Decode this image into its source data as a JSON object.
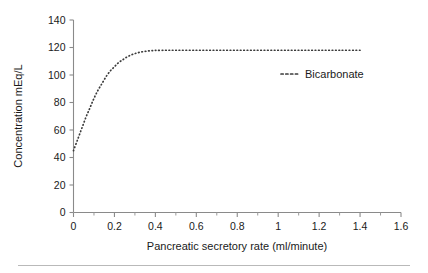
{
  "chart_data": {
    "type": "line",
    "title": "",
    "xlabel": "Pancreatic secretory rate (ml/minute)",
    "ylabel": "Concentration mEq/L",
    "xlim": [
      0,
      1.6
    ],
    "ylim": [
      0,
      140
    ],
    "grid": false,
    "legend_position": "inside-right",
    "xticks": [
      0,
      0.2,
      0.4,
      0.6,
      0.8,
      1,
      1.2,
      1.4,
      1.6
    ],
    "xtick_labels": [
      "0",
      "0.2",
      "0.4",
      "0.6",
      "0.8",
      "1",
      "1.2",
      "1.4",
      "1.6"
    ],
    "xtick_minor_step": 0.1,
    "yticks": [
      0,
      20,
      40,
      60,
      80,
      100,
      120,
      140
    ],
    "ytick_labels": [
      "0",
      "20",
      "40",
      "60",
      "80",
      "100",
      "120",
      "140"
    ],
    "series": [
      {
        "name": "Bicarbonate",
        "style": "dotted",
        "color": "#3b3b3b",
        "x": [
          0.0,
          0.02,
          0.04,
          0.06,
          0.08,
          0.1,
          0.12,
          0.14,
          0.16,
          0.18,
          0.2,
          0.22,
          0.24,
          0.26,
          0.28,
          0.3,
          0.32,
          0.34,
          0.36,
          0.38,
          0.4,
          0.45,
          0.5,
          0.6,
          0.7,
          0.8,
          0.9,
          1.0,
          1.1,
          1.2,
          1.3,
          1.4
        ],
        "values": [
          45,
          53,
          61,
          69,
          76,
          83,
          89,
          94,
          99,
          103,
          106,
          109,
          111,
          113,
          114.5,
          115.6,
          116.4,
          117.0,
          117.4,
          117.7,
          117.9,
          118.0,
          118.0,
          118.0,
          118.0,
          118.0,
          118.0,
          118.0,
          118.0,
          118.0,
          118.0,
          118.0
        ]
      }
    ]
  },
  "legend": {
    "entries": [
      {
        "label": "Bicarbonate"
      }
    ]
  }
}
